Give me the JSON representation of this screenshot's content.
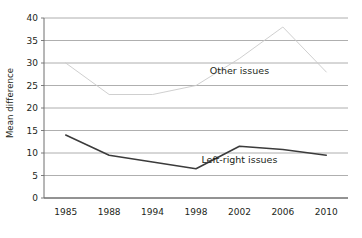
{
  "chart_data": {
    "type": "line",
    "title": "",
    "subtitle": "",
    "xlabel": "",
    "ylabel": "Mean difference",
    "categories": [
      "1985",
      "1988",
      "1994",
      "1998",
      "2002",
      "2006",
      "2010"
    ],
    "ylim": [
      0,
      40
    ],
    "yticks": [
      0,
      5,
      10,
      15,
      20,
      25,
      30,
      35,
      40
    ],
    "ytick_labels": [
      "0",
      "5",
      "10",
      "15",
      "20",
      "25",
      "30",
      "35",
      "40"
    ],
    "grid": true,
    "grid_axis": "y",
    "legend_position": "inline-annotation",
    "series": [
      {
        "name": "Other issues",
        "values": [
          30,
          23,
          23,
          25,
          31,
          38,
          28
        ],
        "color": "#c9c9c9",
        "line_width": 0.9,
        "label_x_category": "2002",
        "label_value": 27.5
      },
      {
        "name": "Left-right issues",
        "values": [
          14,
          9.5,
          8,
          6.5,
          11.5,
          10.8,
          9.5
        ],
        "color": "#3b3b3b",
        "line_width": 1.5,
        "label_x_category": "2002",
        "label_value": 7.8
      }
    ],
    "annotations": [
      {
        "text": "Other issues",
        "series": "Other issues"
      },
      {
        "text": "Left-right issues",
        "series": "Left-right issues"
      }
    ]
  },
  "axes": {
    "y_axis_label": "Mean difference",
    "y_tick_labels": [
      "40",
      "35",
      "30",
      "25",
      "20",
      "15",
      "10",
      "5",
      "0"
    ],
    "x_tick_labels": [
      "1985",
      "1988",
      "1994",
      "1998",
      "2002",
      "2006",
      "2010"
    ]
  },
  "colors": {
    "background": "#ffffff",
    "axis": "#6e6e6e",
    "grid": "#9a9a9a",
    "series_other": "#c9c9c9",
    "series_leftright": "#3b3b3b",
    "text": "#231f20"
  }
}
